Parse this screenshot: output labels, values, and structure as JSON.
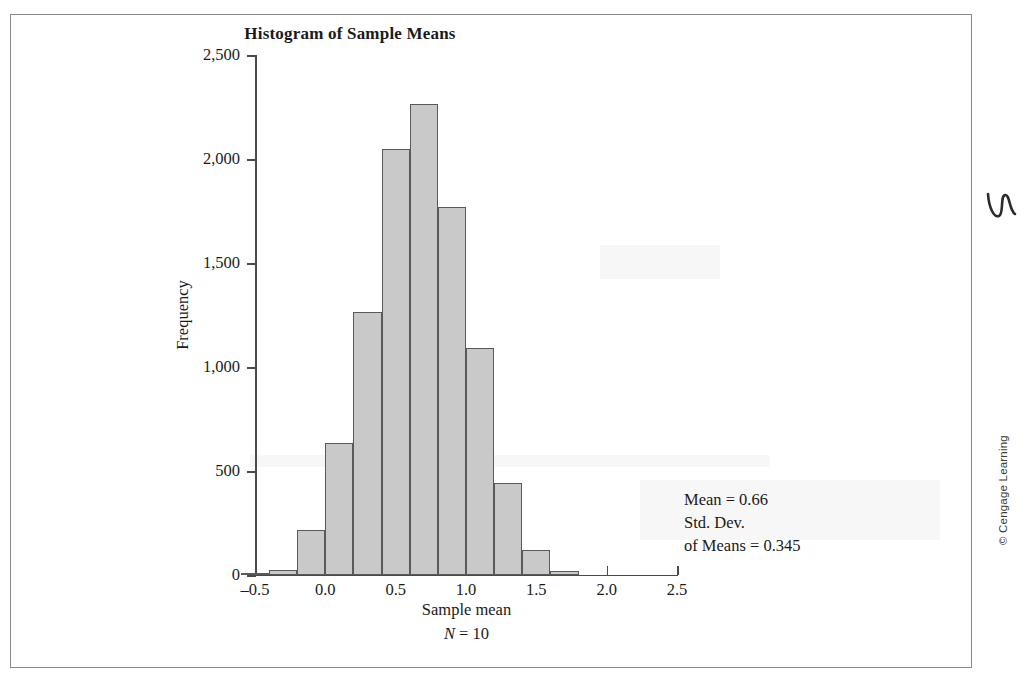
{
  "figure": {
    "credit": "© Cengage Learning",
    "squiggle_icon": "squiggle-mark-icon"
  },
  "annotation": {
    "line1": "Mean = 0.66",
    "line2": "Std. Dev.",
    "line3": "of Means = 0.345"
  },
  "axis": {
    "y_title": "Frequency",
    "x_title": "Sample mean",
    "x_subtitle_symbol": "N",
    "x_subtitle_rest": " = 10"
  },
  "chart_data": {
    "type": "bar",
    "title": "Histogram of Sample Means",
    "xlabel": "Sample mean",
    "ylabel": "Frequency",
    "xlim": [
      -0.5,
      2.5
    ],
    "ylim": [
      0,
      2500
    ],
    "grid": false,
    "legend": null,
    "bar_color": "#c9c9c9",
    "bar_edge_color": "#5a5a5a",
    "xticks": [
      -0.5,
      0.0,
      0.5,
      1.0,
      1.5,
      2.0,
      2.5
    ],
    "xtick_labels": [
      "–0.5",
      "0.0",
      "0.5",
      "1.0",
      "1.5",
      "2.0",
      "2.5"
    ],
    "yticks": [
      0,
      500,
      1000,
      1500,
      2000,
      2500
    ],
    "ytick_labels": [
      "0",
      "500",
      "1,000",
      "1,500",
      "2,000",
      "2,500"
    ],
    "bin_width": 0.2,
    "bins": [
      {
        "left": -0.6,
        "right": -0.4,
        "value": 8
      },
      {
        "left": -0.4,
        "right": -0.2,
        "value": 25
      },
      {
        "left": -0.2,
        "right": 0.0,
        "value": 215
      },
      {
        "left": 0.0,
        "right": 0.2,
        "value": 635
      },
      {
        "left": 0.2,
        "right": 0.4,
        "value": 1265
      },
      {
        "left": 0.4,
        "right": 0.6,
        "value": 2050
      },
      {
        "left": 0.6,
        "right": 0.8,
        "value": 2265
      },
      {
        "left": 0.8,
        "right": 1.0,
        "value": 1770
      },
      {
        "left": 1.0,
        "right": 1.2,
        "value": 1090
      },
      {
        "left": 1.2,
        "right": 1.4,
        "value": 440
      },
      {
        "left": 1.4,
        "right": 1.6,
        "value": 120
      },
      {
        "left": 1.6,
        "right": 1.8,
        "value": 20
      }
    ],
    "annotations": [
      "Mean = 0.66",
      "Std. Dev. of Means = 0.345",
      "N = 10"
    ]
  }
}
